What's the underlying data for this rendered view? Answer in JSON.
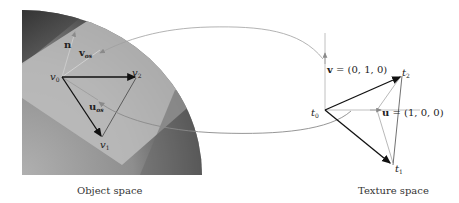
{
  "object_space": {
    "caption": "Object space",
    "labels": {
      "n": "n",
      "v_os": "v",
      "v_os_sub": "os",
      "u_os": "u",
      "u_os_sub": "os",
      "v0": "v",
      "v0_sub": "0",
      "v1": "v",
      "v1_sub": "1",
      "v2": "v",
      "v2_sub": "2"
    }
  },
  "texture_space": {
    "caption": "Texture space",
    "labels": {
      "v_vec": "v",
      "v_value": " = (0, 1, 0)",
      "u_vec": "u",
      "u_value": " = (1, 0, 0)",
      "t0": "t",
      "t0_sub": "0",
      "t1": "t",
      "t1_sub": "1",
      "t2": "t",
      "t2_sub": "2"
    }
  },
  "colors": {
    "disk_dark": "#3a3a3a",
    "disk_mid": "#8a8a8a",
    "plane_light": "#b8b8b8",
    "arrow_dark": "#111111",
    "curve_gray": "#9a9a9a"
  }
}
